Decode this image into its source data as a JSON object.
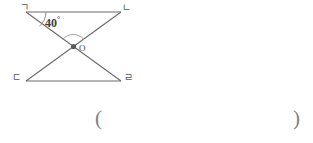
{
  "figure": {
    "type": "geometry-diagram",
    "vertices": [
      {
        "name": "vertex-top-left",
        "label": "ㄱ",
        "x": 25,
        "y": 12
      },
      {
        "name": "vertex-top-right",
        "label": "ㄴ",
        "x": 122,
        "y": 12
      },
      {
        "name": "vertex-bottom-left",
        "label": "ㄷ",
        "x": 25,
        "y": 81
      },
      {
        "name": "vertex-bottom-right",
        "label": "ㄹ",
        "x": 122,
        "y": 81
      }
    ],
    "intersection": {
      "label": "O",
      "x": 73,
      "y": 47
    },
    "angle": {
      "value": "40",
      "degree_symbol": "°",
      "at_vertex": "ㄱ"
    },
    "colors": {
      "stroke": "#6b6b6b",
      "text": "#4a4a4a",
      "arc": "#9a9a9a",
      "background": "#ffffff"
    }
  },
  "answer": {
    "open_paren": "(",
    "close_paren": ")",
    "value": ""
  }
}
